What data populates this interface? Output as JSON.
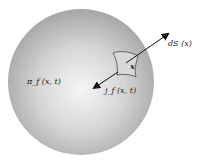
{
  "diagram": {
    "type": "physics-illustration",
    "colors": {
      "background": "#ffffff",
      "sphere_center": "#f4f4f4",
      "sphere_edge": "#a8a8a8",
      "arrow": "#111111",
      "patch_fill": "#dcdcdc",
      "patch_stroke": "#333333"
    },
    "labels": {
      "density": "π_f (x, t)",
      "surface_element": "dS (x)",
      "point": "x",
      "current": "j_f (x, t)"
    }
  }
}
